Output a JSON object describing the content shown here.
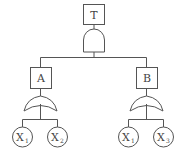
{
  "diagram": {
    "type": "fault-tree",
    "colors": {
      "stroke": "#555555",
      "text": "#444444",
      "background": "#ffffff"
    },
    "top_event": {
      "label": "T",
      "gate": "AND"
    },
    "intermediate_events": [
      {
        "label": "A",
        "gate": "OR",
        "inputs": [
          {
            "base": "X",
            "sub": "1"
          },
          {
            "base": "X",
            "sub": "2"
          }
        ]
      },
      {
        "label": "B",
        "gate": "OR",
        "inputs": [
          {
            "base": "X",
            "sub": "1"
          },
          {
            "base": "X",
            "sub": "3"
          }
        ]
      }
    ]
  }
}
